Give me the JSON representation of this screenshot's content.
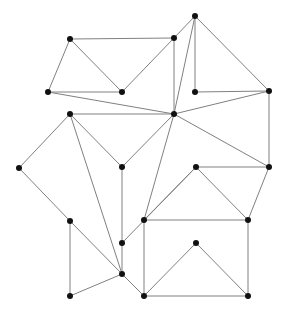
{
  "diagram": {
    "type": "undirected-graph",
    "width": 284,
    "height": 314,
    "edge_color": "#808080",
    "node_color": "#111111",
    "node_radius": 3,
    "nodes": [
      {
        "id": "n0",
        "x": 70,
        "y": 39
      },
      {
        "id": "n1",
        "x": 174,
        "y": 38
      },
      {
        "id": "n2",
        "x": 195,
        "y": 16
      },
      {
        "id": "n3",
        "x": 48,
        "y": 92
      },
      {
        "id": "n4",
        "x": 122,
        "y": 92
      },
      {
        "id": "n5",
        "x": 195,
        "y": 92
      },
      {
        "id": "n6",
        "x": 269,
        "y": 91
      },
      {
        "id": "n7",
        "x": 70,
        "y": 114
      },
      {
        "id": "n8",
        "x": 174,
        "y": 114
      },
      {
        "id": "n9",
        "x": 19,
        "y": 168
      },
      {
        "id": "n10",
        "x": 122,
        "y": 167
      },
      {
        "id": "n11",
        "x": 196,
        "y": 167
      },
      {
        "id": "n12",
        "x": 269,
        "y": 167
      },
      {
        "id": "n13",
        "x": 70,
        "y": 221
      },
      {
        "id": "n14",
        "x": 144,
        "y": 220
      },
      {
        "id": "n15",
        "x": 248,
        "y": 220
      },
      {
        "id": "n16",
        "x": 122,
        "y": 243
      },
      {
        "id": "n17",
        "x": 196,
        "y": 243
      },
      {
        "id": "n18",
        "x": 122,
        "y": 274
      },
      {
        "id": "n19",
        "x": 70,
        "y": 296
      },
      {
        "id": "n20",
        "x": 144,
        "y": 296
      },
      {
        "id": "n21",
        "x": 248,
        "y": 296
      }
    ],
    "edges": [
      [
        "n0",
        "n1"
      ],
      [
        "n0",
        "n3"
      ],
      [
        "n0",
        "n4"
      ],
      [
        "n4",
        "n1"
      ],
      [
        "n1",
        "n2"
      ],
      [
        "n1",
        "n8"
      ],
      [
        "n2",
        "n8"
      ],
      [
        "n2",
        "n5"
      ],
      [
        "n2",
        "n6"
      ],
      [
        "n5",
        "n6"
      ],
      [
        "n6",
        "n8"
      ],
      [
        "n6",
        "n12"
      ],
      [
        "n3",
        "n4"
      ],
      [
        "n3",
        "n8"
      ],
      [
        "n8",
        "n7"
      ],
      [
        "n8",
        "n12"
      ],
      [
        "n8",
        "n10"
      ],
      [
        "n8",
        "n14"
      ],
      [
        "n7",
        "n9"
      ],
      [
        "n7",
        "n10"
      ],
      [
        "n7",
        "n18"
      ],
      [
        "n9",
        "n13"
      ],
      [
        "n13",
        "n18"
      ],
      [
        "n13",
        "n19"
      ],
      [
        "n19",
        "n18"
      ],
      [
        "n10",
        "n18"
      ],
      [
        "n16",
        "n11"
      ],
      [
        "n14",
        "n11"
      ],
      [
        "n11",
        "n12"
      ],
      [
        "n11",
        "n15"
      ],
      [
        "n12",
        "n15"
      ],
      [
        "n14",
        "n15"
      ],
      [
        "n14",
        "n20"
      ],
      [
        "n15",
        "n21"
      ],
      [
        "n17",
        "n20"
      ],
      [
        "n17",
        "n21"
      ],
      [
        "n20",
        "n21"
      ],
      [
        "n18",
        "n20"
      ]
    ]
  }
}
